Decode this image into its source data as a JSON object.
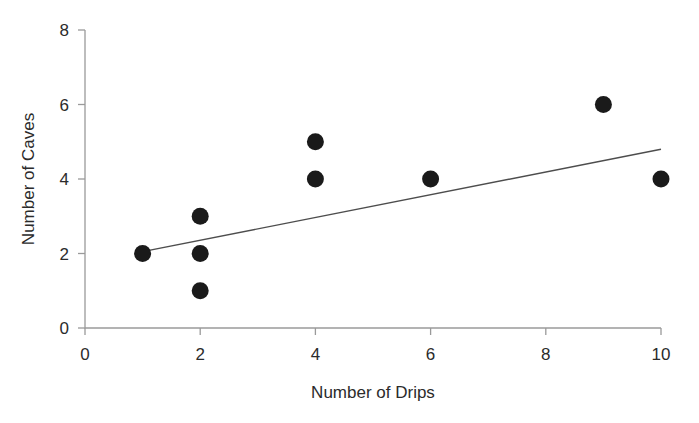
{
  "chart_data": {
    "type": "scatter",
    "title": "",
    "xlabel": "Number of Drips",
    "ylabel": "Number of Caves",
    "xlim": [
      0,
      10
    ],
    "ylim": [
      0,
      8
    ],
    "xticks": [
      0,
      2,
      4,
      6,
      8,
      10
    ],
    "yticks": [
      0,
      2,
      4,
      6,
      8
    ],
    "xtick_labels": [
      "0",
      "2",
      "4",
      "6",
      "8",
      "10"
    ],
    "ytick_labels": [
      "0",
      "2",
      "4",
      "6",
      "8"
    ],
    "grid": false,
    "legend": null,
    "series": [
      {
        "name": "observations",
        "type": "scatter",
        "marker": "filled-circle",
        "color": "#1a1a1a",
        "marker_size_px": 17,
        "x": [
          1,
          2,
          2,
          2,
          4,
          4,
          6,
          9,
          10
        ],
        "y": [
          2,
          3,
          2,
          1,
          5,
          4,
          4,
          6,
          4
        ],
        "points": [
          {
            "x": 1,
            "y": 2
          },
          {
            "x": 2,
            "y": 3
          },
          {
            "x": 2,
            "y": 2
          },
          {
            "x": 2,
            "y": 1
          },
          {
            "x": 4,
            "y": 5
          },
          {
            "x": 4,
            "y": 4
          },
          {
            "x": 6,
            "y": 4
          },
          {
            "x": 9,
            "y": 6
          },
          {
            "x": 10,
            "y": 4
          }
        ]
      },
      {
        "name": "trend-line",
        "type": "line",
        "color": "#4d4d4d",
        "width_px": 1.4,
        "x": [
          1,
          10
        ],
        "y": [
          2.05,
          4.8
        ],
        "slope": 0.306,
        "intercept": 1.744
      }
    ],
    "axis_color": "#9a9a9a",
    "text_color": "#2b2b2b"
  },
  "geometry": {
    "plot_left_px": 85,
    "plot_right_px": 661,
    "plot_bottom_px": 328,
    "plot_top_px": 30
  }
}
